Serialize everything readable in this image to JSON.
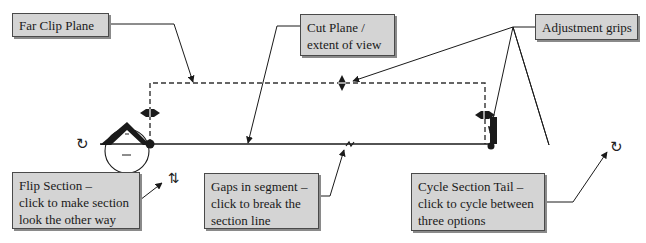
{
  "callouts": {
    "far_clip": {
      "lines": [
        "Far Clip Plane"
      ]
    },
    "cut_plane": {
      "lines": [
        "Cut Plane /",
        "extent of view"
      ]
    },
    "adjustment": {
      "lines": [
        "Adjustment grips"
      ]
    },
    "flip": {
      "lines": [
        "Flip Section –",
        "click to make section",
        "look the other way"
      ]
    },
    "gaps": {
      "lines": [
        "Gaps in segment –",
        "click to break the",
        "section line"
      ]
    },
    "cycle": {
      "lines": [
        "Cycle Section Tail –",
        "click to cycle between",
        "three options"
      ]
    }
  },
  "icons": {
    "cycle_left": "↻",
    "cycle_right": "↻",
    "flip": "⇅"
  },
  "colors": {
    "callout_bg": "#d4d4d4",
    "line": "#1a1a1a"
  }
}
